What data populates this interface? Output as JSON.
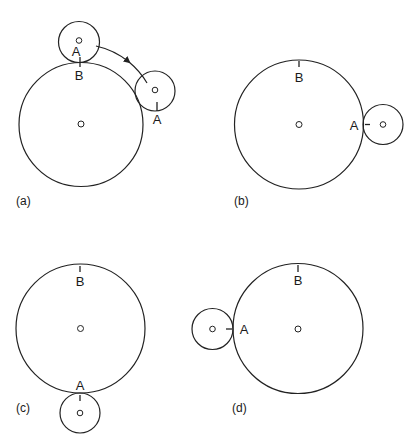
{
  "figure": {
    "panels": [
      {
        "id": "a",
        "caption": "(a)",
        "big_circle": {
          "cx": 81,
          "cy": 124.5,
          "r": 62
        },
        "small_circles": [
          {
            "cx": 79,
            "cy": 42,
            "r": 20.5,
            "label": "A"
          },
          {
            "cx": 155,
            "cy": 91,
            "r": 20,
            "label": "A"
          }
        ],
        "big_label": "B",
        "arrow": "rotation-arrow"
      },
      {
        "id": "b",
        "caption": "(b)",
        "big_circle": {
          "cx": 299,
          "cy": 124.5,
          "r": 64.5
        },
        "small_circles": [
          {
            "cx": 383,
            "cy": 124.5,
            "r": 20,
            "label": "A"
          }
        ],
        "big_label": "B"
      },
      {
        "id": "c",
        "caption": "(c)",
        "big_circle": {
          "cx": 80.5,
          "cy": 328.5,
          "r": 64.5
        },
        "small_circles": [
          {
            "cx": 80,
            "cy": 413,
            "r": 20,
            "label": "A"
          }
        ],
        "big_label": "B"
      },
      {
        "id": "d",
        "caption": "(d)",
        "big_circle": {
          "cx": 298,
          "cy": 328.5,
          "r": 65
        },
        "small_circles": [
          {
            "cx": 212.5,
            "cy": 329,
            "r": 20.5,
            "label": "A"
          }
        ],
        "big_label": "B"
      }
    ],
    "labels": {
      "a_small1": "A",
      "a_small2": "A",
      "a_big": "B",
      "a_caption": "(a)",
      "b_small": "A",
      "b_big": "B",
      "b_caption": "(b)",
      "c_small": "A",
      "c_big": "B",
      "c_caption": "(c)",
      "d_small": "A",
      "d_big": "B",
      "d_caption": "(d)"
    },
    "colors": {
      "line": "#222222",
      "background": "#ffffff"
    }
  }
}
